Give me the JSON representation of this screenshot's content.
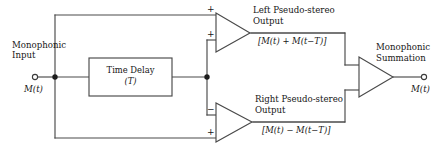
{
  "diagram": {
    "colors": {
      "line": "#4a4a4a",
      "line_dark": "#2b2b2b",
      "text": "#161616",
      "background": "#ffffff"
    },
    "input": {
      "label_line1": "Monophonic",
      "label_line2": "Input",
      "signal": "M(t)",
      "terminal": "input-terminal"
    },
    "delay_block": {
      "label_line1": "Time Delay",
      "label_line2": "(T)"
    },
    "left_amp": {
      "title_line1": "Left Pseudo-stereo",
      "title_line2": "Output",
      "expression": "[M(t) + M(t−T)]",
      "input_top_sign": "+",
      "input_bottom_sign": "+"
    },
    "right_amp": {
      "title_line1": "Right Pseudo-stereo",
      "title_line2": "Output",
      "expression": "[M(t) − M(t−T)]",
      "input_top_sign": "−",
      "input_bottom_sign": "+"
    },
    "summation_amp": {
      "title_line1": "Monophonic",
      "title_line2": "Summation",
      "output_signal": "M(t)",
      "terminal": "output-terminal"
    }
  }
}
